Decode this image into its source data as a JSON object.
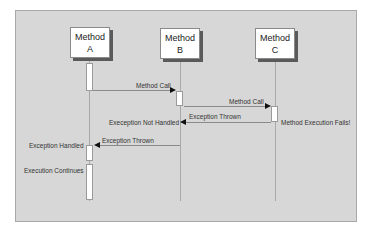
{
  "diagram": {
    "type": "sequence-diagram",
    "objects": [
      {
        "line1": "Method",
        "line2": "A"
      },
      {
        "line1": "Method",
        "line2": "B"
      },
      {
        "line1": "Method",
        "line2": "C"
      }
    ],
    "messages": [
      {
        "label": "Method Call",
        "from": "A",
        "to": "B"
      },
      {
        "label": "Method Call",
        "from": "B",
        "to": "C"
      },
      {
        "label": "Exception Thrown",
        "from": "C",
        "to": "B"
      },
      {
        "label": "Exception Thrown",
        "from": "B",
        "to": "A"
      }
    ],
    "notes": {
      "c_fail": "Method Execution Fails!",
      "b_not_handled": "Exeception Not Handled",
      "a_handled": "Exception Handled",
      "a_continues": "Execution Continues"
    },
    "colors": {
      "background": "#d7d7d7",
      "box_fill": "#ffffff",
      "shadow": "#5a5a5a",
      "arrowhead": "#111111"
    }
  }
}
